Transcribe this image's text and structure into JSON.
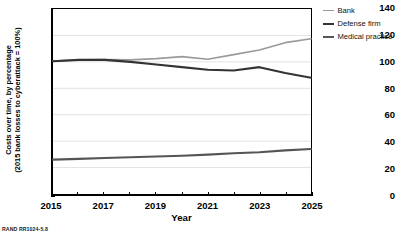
{
  "chart_data": {
    "type": "line",
    "title": "",
    "xlabel": "Year",
    "ylabel": "Costs over time, by percentage (2015 bank losses to cyberattack = 100%)",
    "ylabel_line1": "Costs over time, by percentage",
    "ylabel_line2": "(2015 bank losses to cyberattack = 100%)",
    "x": [
      2015,
      2016,
      2017,
      2018,
      2019,
      2020,
      2021,
      2022,
      2023,
      2024,
      2025
    ],
    "xlim": [
      2015,
      2025
    ],
    "ylim": [
      0,
      140
    ],
    "ytick_values": [
      0,
      20,
      40,
      60,
      80,
      100,
      120,
      140
    ],
    "ytick_labels": [
      "0",
      "20",
      "40",
      "60",
      "80",
      "100",
      "120",
      "140"
    ],
    "xtick_values": [
      2015,
      2016,
      2017,
      2018,
      2019,
      2020,
      2021,
      2022,
      2023,
      2024,
      2025
    ],
    "xtick_labels": [
      "2015",
      "",
      "2017",
      "",
      "2019",
      "",
      "2021",
      "",
      "2023",
      "",
      "2025"
    ],
    "grid": "horizontal",
    "legend_position": "right",
    "series": [
      {
        "name": "Bank",
        "color": "#9a9a9a",
        "values": [
          100.5,
          101.5,
          101.8,
          101.5,
          102.5,
          104.0,
          102.0,
          105.5,
          109.0,
          114.5,
          117.5
        ]
      },
      {
        "name": "Defense firm",
        "color": "#333333",
        "values": [
          100.5,
          101.5,
          101.5,
          100.0,
          98.0,
          96.0,
          94.0,
          93.5,
          96.0,
          91.5,
          88.0
        ]
      },
      {
        "name": "Medical practice",
        "color": "#555555",
        "values": [
          26.0,
          26.6,
          27.2,
          27.8,
          28.4,
          29.0,
          29.8,
          30.8,
          31.6,
          33.0,
          34.0
        ]
      }
    ]
  },
  "legend": {
    "items": [
      {
        "label": "Bank",
        "color": "#9a9a9a",
        "width": 1.6
      },
      {
        "label": "Defense firm",
        "color": "#333333",
        "width": 2.4
      },
      {
        "label": "Medical practice",
        "color": "#555555",
        "width": 2.4
      }
    ]
  },
  "source": {
    "note": "RAND RR1024-5.8"
  }
}
